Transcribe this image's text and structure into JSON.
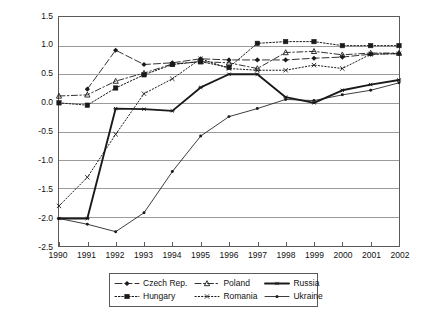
{
  "chart_data": {
    "type": "line",
    "title": "",
    "subtitle": "",
    "xlabel": "",
    "ylabel": "",
    "grid": "horizontal",
    "legend_position": "bottom",
    "xlim": [
      1990,
      2002
    ],
    "ylim": [
      -2.5,
      1.5
    ],
    "ytick_step": 0.5,
    "categories": [
      "1990",
      "1991",
      "1992",
      "1993",
      "1994",
      "1995",
      "1996",
      "1997",
      "1998",
      "1999",
      "2000",
      "2001",
      "2002"
    ],
    "ytick_labels": [
      "1.5",
      "1.0",
      "0.5",
      "0.0",
      "-0.5",
      "-1.0",
      "-1.5",
      "-2.0",
      "-2.5"
    ],
    "ytick_values": [
      1.5,
      1.0,
      0.5,
      0.0,
      -0.5,
      -1.0,
      -1.5,
      -2.0,
      -2.5
    ],
    "series": [
      {
        "name": "Czech Rep.",
        "color": "#1a1a1a",
        "dash": "long-dash-dot",
        "marker": "diamond",
        "values": [
          null,
          0.24,
          0.92,
          0.67,
          0.7,
          0.77,
          0.75,
          0.75,
          0.75,
          0.78,
          0.8,
          0.85,
          0.86
        ]
      },
      {
        "name": "Hungary",
        "color": "#1a1a1a",
        "dash": "dotted",
        "marker": "square",
        "values": [
          0.0,
          -0.04,
          0.26,
          0.49,
          0.67,
          0.72,
          0.62,
          1.04,
          1.07,
          1.07,
          1.0,
          1.0,
          1.0
        ]
      },
      {
        "name": "Poland",
        "color": "#1a1a1a",
        "dash": "dash-dot",
        "marker": "triangle",
        "values": [
          0.12,
          0.14,
          0.38,
          0.52,
          0.68,
          0.72,
          0.7,
          0.6,
          0.88,
          0.9,
          0.84,
          0.87,
          0.87
        ]
      },
      {
        "name": "Romania",
        "color": "#1a1a1a",
        "dash": "fine-dotted",
        "marker": "cross",
        "values": [
          -1.8,
          -1.3,
          -0.55,
          0.16,
          0.42,
          0.77,
          0.6,
          0.57,
          0.57,
          0.66,
          0.6,
          0.85,
          0.86
        ]
      },
      {
        "name": "Russia",
        "color": "#1a1a1a",
        "dash": "solid-thick",
        "marker": "asterisk",
        "values": [
          -2.02,
          -2.02,
          -0.1,
          -0.11,
          -0.14,
          0.27,
          0.5,
          0.5,
          0.1,
          0.0,
          0.22,
          0.32,
          0.4
        ]
      },
      {
        "name": "Ukraine",
        "color": "#1a1a1a",
        "dash": "solid-thin",
        "marker": "dot",
        "values": [
          -2.02,
          -2.12,
          -2.25,
          -1.92,
          -1.2,
          -0.58,
          -0.24,
          -0.1,
          0.06,
          0.04,
          0.14,
          0.22,
          0.35
        ]
      }
    ]
  }
}
